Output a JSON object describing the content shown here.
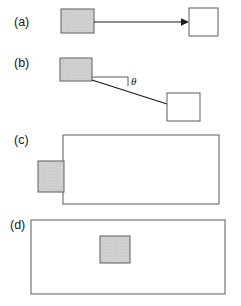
{
  "figure": {
    "width": 241,
    "height": 306,
    "background": "#ffffff",
    "colors": {
      "gray_fill": "#cfcfcf",
      "outline": "#6b6b6b",
      "line": "#1a1a1a",
      "text": "#161616"
    }
  },
  "panels": [
    {
      "id": "a",
      "label": "(a)",
      "label_x": 14,
      "label_y": 26,
      "description": "gray square connected by a horizontal arrow pointing right to a white square",
      "shapes": [
        {
          "name": "gray-square",
          "type": "rect",
          "fill": "gray",
          "x": 61,
          "y": 9,
          "w": 33,
          "h": 24
        },
        {
          "name": "white-square",
          "type": "rect",
          "fill": "white",
          "x": 189,
          "y": 8,
          "w": 29,
          "h": 28
        }
      ],
      "connector": {
        "name": "arrow",
        "type": "arrow",
        "x1": 94,
        "y1": 22,
        "x2": 189,
        "y2": 22
      }
    },
    {
      "id": "b",
      "label": "(b)",
      "label_x": 14,
      "label_y": 67,
      "description": "gray square connected by a downward sloping line to a white square, with angle theta marked from horizontal",
      "shapes": [
        {
          "name": "gray-square",
          "type": "rect",
          "fill": "gray",
          "x": 60,
          "y": 58,
          "w": 32,
          "h": 23
        },
        {
          "name": "white-square",
          "type": "rect",
          "fill": "white",
          "x": 167,
          "y": 93,
          "w": 33,
          "h": 28
        }
      ],
      "connector": {
        "name": "sloped-line",
        "type": "line",
        "x1": 92,
        "y1": 80,
        "x2": 167,
        "y2": 104
      },
      "reference_line": {
        "name": "horizontal-reference",
        "x1": 92,
        "y1": 77,
        "x2": 128,
        "y2": 77,
        "tick_bottom_y": 86
      },
      "angle": {
        "name": "theta",
        "symbol": "θ",
        "x": 131,
        "y": 85
      }
    },
    {
      "id": "c",
      "label": "(c)",
      "label_x": 14,
      "label_y": 144,
      "description": "large white rectangle with a gray square straddling its left edge",
      "shapes": [
        {
          "name": "large-rectangle",
          "type": "rect",
          "fill": "white",
          "x": 63,
          "y": 135,
          "w": 156,
          "h": 69
        },
        {
          "name": "gray-square",
          "type": "rect",
          "fill": "gray",
          "x": 38,
          "y": 161,
          "w": 26,
          "h": 31
        }
      ]
    },
    {
      "id": "d",
      "label": "(d)",
      "label_x": 10,
      "label_y": 229,
      "description": "wide white rectangle with a gray square fully inside, upper middle",
      "shapes": [
        {
          "name": "wide-rectangle",
          "type": "rect",
          "fill": "white",
          "x": 31,
          "y": 220,
          "w": 194,
          "h": 74
        },
        {
          "name": "gray-square",
          "type": "rect",
          "fill": "gray",
          "x": 100,
          "y": 236,
          "w": 30,
          "h": 27
        }
      ]
    }
  ]
}
